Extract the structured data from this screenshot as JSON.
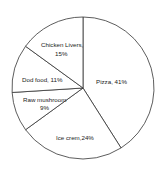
{
  "chart_data": {
    "type": "pie",
    "title": "",
    "start_angle_deg": 0,
    "direction": "clockwise",
    "slices": [
      {
        "label": "Pizza",
        "value": 41,
        "display": "Pizza, 41%"
      },
      {
        "label": "Ice crem",
        "value": 24,
        "display": "Ice crem,24%"
      },
      {
        "label": "Raw mushroom",
        "value": 9,
        "display": "Raw mushroom 9%"
      },
      {
        "label": "Dod food",
        "value": 11,
        "display": "Dod food, 11%"
      },
      {
        "label": "Chicken Livers",
        "value": 15,
        "display": "Chicken Livers, 15%"
      }
    ],
    "colors": {
      "fill": "#ffffff",
      "stroke": "#333333"
    },
    "legend": "none"
  },
  "labels": {
    "pizza": "Pizza, 41%",
    "ice_cream": "Ice crem,24%",
    "raw_mushroom_line1": "Raw mushroom",
    "raw_mushroom_line2": "9%",
    "dog_food": "Dod food, 11%",
    "chicken_livers_line1": "Chicken Livers,",
    "chicken_livers_line2": "15%"
  }
}
